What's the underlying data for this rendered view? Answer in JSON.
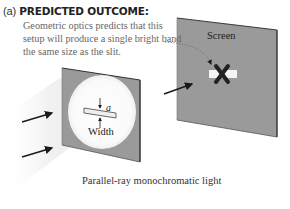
{
  "heading": {
    "label": "(a)",
    "title": "PREDICTED OUTCOME:"
  },
  "prediction_text": "Geometric optics predicts that this setup will produce a single bright band the same size as the slit.",
  "screen": {
    "label": "Screen",
    "marker": "✕"
  },
  "slit": {
    "width_label": "Width",
    "width_symbol": "a"
  },
  "light_caption": "Parallel-ray monochromatic light",
  "colors": {
    "panel_gray": "#9a9a9a",
    "panel_edge": "#4a4a4a",
    "beam": "#f0f0f0",
    "arrow": "#1a1a1a",
    "text_gray": "#666666"
  }
}
